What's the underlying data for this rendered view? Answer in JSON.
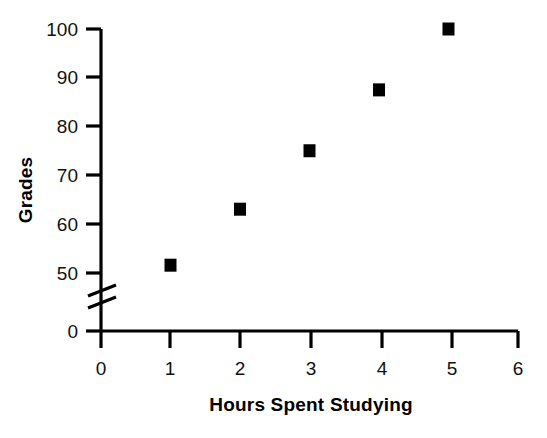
{
  "chart_data": {
    "type": "scatter",
    "title": "",
    "xlabel": "Hours Spent Studying",
    "ylabel": "Grades",
    "x": [
      1,
      2,
      3,
      4,
      5
    ],
    "values": [
      51.5,
      63,
      75,
      87.5,
      100
    ],
    "series": [
      {
        "name": "Grades vs Hours Spent Studying",
        "x": [
          1,
          2,
          3,
          4,
          5
        ],
        "values": [
          51.5,
          63,
          75,
          87.5,
          100
        ]
      }
    ],
    "xlim": [
      0,
      6
    ],
    "ylim": [
      0,
      100
    ],
    "xticks": [
      "0",
      "1",
      "2",
      "3",
      "4",
      "5",
      "6"
    ],
    "yticks": [
      "0",
      "50",
      "60",
      "70",
      "80",
      "90",
      "100"
    ],
    "y_axis_break": true,
    "y_break_between": [
      0,
      50
    ],
    "grid": false,
    "legend": false,
    "marker_style": "filled-square",
    "marker_color": "#000000"
  },
  "axes": {
    "x_title": "Hours Spent Studying",
    "y_title": "Grades",
    "x_tick_labels": [
      "0",
      "1",
      "2",
      "3",
      "4",
      "5",
      "6"
    ],
    "y_tick_labels": [
      "100",
      "90",
      "80",
      "70",
      "60",
      "50",
      "0"
    ]
  },
  "colors": {
    "background": "#ffffff",
    "ink": "#000000",
    "marker": "#000000"
  }
}
